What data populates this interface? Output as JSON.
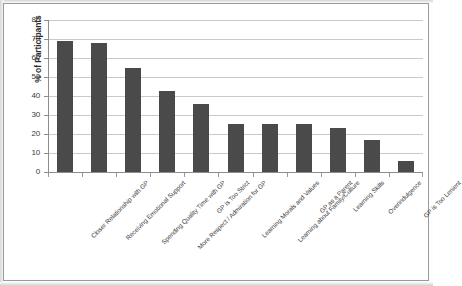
{
  "chart_data": {
    "type": "bar",
    "title": "",
    "subtitle": "",
    "xlabel": "",
    "ylabel": "% of Participants",
    "ylim": [
      0,
      80
    ],
    "ytick_labels": [
      "80",
      "70",
      "60",
      "50",
      "40",
      "30",
      "20",
      "10",
      "0"
    ],
    "ytick_values": [
      80,
      70,
      60,
      50,
      40,
      30,
      20,
      10,
      0
    ],
    "grid": true,
    "legend": false,
    "legend_position": "none",
    "bar_color": "#4a4a4a",
    "gridline_color": "#c9c9c9",
    "axis_color": "#8d8d8d",
    "categories": [
      "Closer Relationship with GP",
      "Receiving Emotional Support",
      "Spending Quality Time with GP",
      "More Respect / Admiration for GP",
      "GP is Too Strict",
      "Learning Morals and Values",
      "Learning about Family/Culture",
      "GP as a Parent",
      "Learning Skills",
      "Overindulgence",
      "GP is Too Lenient"
    ],
    "values": [
      69,
      68,
      54.5,
      42.5,
      36,
      25,
      25,
      25,
      23,
      17,
      6
    ]
  }
}
